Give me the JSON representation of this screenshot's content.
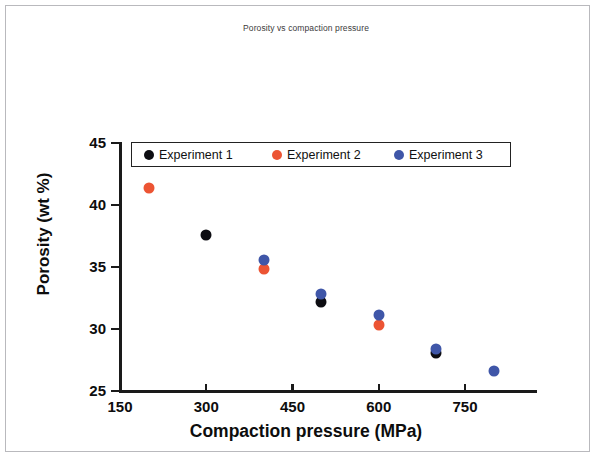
{
  "chart_data": {
    "type": "scatter",
    "title": "Porosity vs compaction pressure",
    "xlabel": "Compaction pressure (MPa)",
    "ylabel": "Porosity (wt %)",
    "xlim": [
      150,
      800
    ],
    "ylim": [
      25,
      45
    ],
    "xticks": [
      150,
      300,
      450,
      600,
      750
    ],
    "yticks": [
      25,
      30,
      35,
      40,
      45
    ],
    "grid": false,
    "legend_position": "top-left-inside",
    "series": [
      {
        "name": "Experiment 1",
        "color": "#0d0d12",
        "marker": "circle",
        "points": [
          {
            "x": 300,
            "y": 37.6
          },
          {
            "x": 500,
            "y": 32.2
          },
          {
            "x": 700,
            "y": 28.1
          }
        ]
      },
      {
        "name": "Experiment 2",
        "color": "#ec5433",
        "marker": "circle",
        "points": [
          {
            "x": 200,
            "y": 41.4
          },
          {
            "x": 400,
            "y": 34.8
          },
          {
            "x": 600,
            "y": 30.3
          }
        ]
      },
      {
        "name": "Experiment 3",
        "color": "#3f56a8",
        "marker": "circle",
        "points": [
          {
            "x": 400,
            "y": 35.6
          },
          {
            "x": 500,
            "y": 32.8
          },
          {
            "x": 600,
            "y": 31.1
          },
          {
            "x": 700,
            "y": 28.4
          },
          {
            "x": 800,
            "y": 26.6
          }
        ]
      }
    ]
  },
  "title": {
    "text": "Porosity vs compaction pressure"
  },
  "axes": {
    "x_title": "Compaction pressure (MPa)",
    "y_title": "Porosity (wt %)",
    "x_tick_labels": [
      "150",
      "300",
      "450",
      "600",
      "750"
    ],
    "y_tick_labels": [
      "45",
      "40",
      "35",
      "30",
      "25"
    ]
  },
  "legend": {
    "entries": [
      {
        "label": "Experiment 1",
        "color": "#0d0d12"
      },
      {
        "label": "Experiment 2",
        "color": "#ec5433"
      },
      {
        "label": "Experiment 3",
        "color": "#3f56a8"
      }
    ]
  },
  "colors": {
    "experiment_1": "#0d0d12",
    "experiment_2": "#ec5433",
    "experiment_3": "#3f56a8",
    "axis": "#1a1a1a",
    "frame": "#b9b9bd",
    "background": "#ffffff"
  }
}
